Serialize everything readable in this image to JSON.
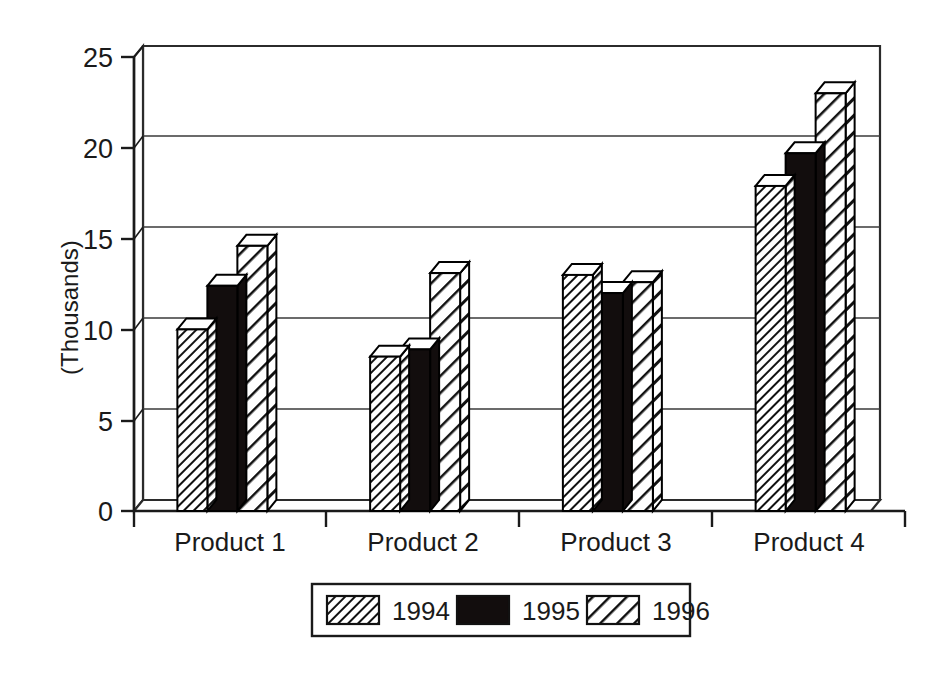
{
  "chart_data": {
    "type": "bar",
    "title": "",
    "subtitle": "",
    "xlabel": "",
    "ylabel": "(Thousands)",
    "categories": [
      "Product 1",
      "Product 2",
      "Product 3",
      "Product 4"
    ],
    "series": [
      {
        "name": "1994",
        "values": [
          10.0,
          8.5,
          13.0,
          17.9
        ]
      },
      {
        "name": "1995",
        "values": [
          12.4,
          8.9,
          12.0,
          19.7
        ]
      },
      {
        "name": "1996",
        "values": [
          14.6,
          13.1,
          12.6,
          23.0
        ]
      }
    ],
    "ylim": [
      0,
      25
    ],
    "yticks": [
      0,
      5,
      10,
      15,
      20,
      25
    ],
    "ytick_labels": [
      "0",
      "5",
      "10",
      "15",
      "20",
      "25"
    ],
    "grid": true,
    "grid_axis": "y",
    "legend_position": "bottom",
    "style": "3d-bar-monochrome",
    "series_fill": [
      "hatch-dense",
      "solid-black",
      "hatch-wide"
    ],
    "colors": {
      "bar_outline": "#000000",
      "bar_solid": "#120d0d",
      "hatch_line": "#111111",
      "axis": "#1a1a1a",
      "grid": "#3a3a3a",
      "background": "#ffffff",
      "text": "#1a1a1a"
    }
  },
  "axis": {
    "y_label": "(Thousands)",
    "y_ticks": [
      "25",
      "20",
      "15",
      "10",
      "5",
      "0"
    ],
    "x_categories": [
      "Product 1",
      "Product 2",
      "Product 3",
      "Product 4"
    ]
  },
  "legend": {
    "entries": [
      {
        "label": "1994",
        "swatch": "hatch-dense"
      },
      {
        "label": "1995",
        "swatch": "solid-black"
      },
      {
        "label": "1996",
        "swatch": "hatch-wide"
      }
    ]
  }
}
